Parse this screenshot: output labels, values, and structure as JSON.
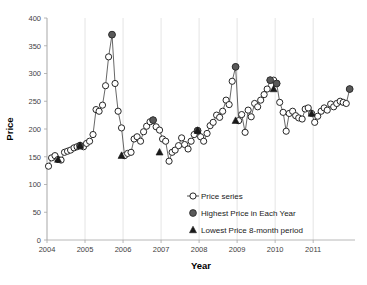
{
  "chart_data": {
    "type": "line",
    "title": "",
    "xlabel": "Year",
    "ylabel": "Price",
    "xlim": [
      2004,
      2012.1
    ],
    "ylim": [
      0,
      400
    ],
    "yticks": [
      0,
      50,
      100,
      150,
      200,
      250,
      300,
      350,
      400
    ],
    "xticks": [
      2004,
      2005,
      2006,
      2007,
      2008,
      2009,
      2010,
      2011
    ],
    "grid": "vertical-only",
    "legend_position": "inside-bottom-right",
    "series": [
      {
        "name": "Price series",
        "marker": "open-circle",
        "x": [
          2004.04,
          2004.12,
          2004.21,
          2004.29,
          2004.37,
          2004.46,
          2004.54,
          2004.62,
          2004.71,
          2004.79,
          2004.87,
          2004.96,
          2005.04,
          2005.12,
          2005.21,
          2005.29,
          2005.37,
          2005.46,
          2005.54,
          2005.62,
          2005.71,
          2005.79,
          2005.87,
          2005.96,
          2006.04,
          2006.12,
          2006.21,
          2006.29,
          2006.37,
          2006.46,
          2006.54,
          2006.62,
          2006.71,
          2006.79,
          2006.87,
          2006.96,
          2007.04,
          2007.12,
          2007.21,
          2007.29,
          2007.37,
          2007.46,
          2007.54,
          2007.62,
          2007.71,
          2007.79,
          2007.87,
          2007.96,
          2008.04,
          2008.12,
          2008.21,
          2008.29,
          2008.37,
          2008.46,
          2008.54,
          2008.62,
          2008.71,
          2008.79,
          2008.87,
          2008.96,
          2009.04,
          2009.12,
          2009.21,
          2009.29,
          2009.37,
          2009.46,
          2009.54,
          2009.62,
          2009.71,
          2009.79,
          2009.87,
          2009.96,
          2010.04,
          2010.12,
          2010.21,
          2010.29,
          2010.37,
          2010.46,
          2010.54,
          2010.62,
          2010.71,
          2010.79,
          2010.87,
          2010.96,
          2011.04,
          2011.12,
          2011.21,
          2011.29,
          2011.37,
          2011.46,
          2011.54,
          2011.62,
          2011.71,
          2011.79,
          2011.87,
          2011.96
        ],
        "y": [
          133,
          148,
          152,
          145,
          144,
          158,
          160,
          162,
          166,
          168,
          170,
          168,
          174,
          178,
          190,
          235,
          232,
          243,
          278,
          330,
          370,
          282,
          232,
          202,
          152,
          156,
          158,
          182,
          186,
          178,
          195,
          205,
          213,
          216,
          204,
          198,
          182,
          178,
          142,
          158,
          162,
          170,
          184,
          172,
          164,
          178,
          190,
          197,
          186,
          178,
          192,
          206,
          212,
          225,
          221,
          232,
          252,
          244,
          286,
          312,
          215,
          226,
          194,
          234,
          222,
          246,
          240,
          252,
          262,
          272,
          288,
          288,
          282,
          248,
          230,
          196,
          228,
          232,
          224,
          220,
          218,
          236,
          238,
          228,
          212,
          223,
          232,
          238,
          234,
          245,
          240,
          246,
          250,
          248,
          246,
          272
        ]
      },
      {
        "name": "Highest Price in Each Year",
        "marker": "filled-circle",
        "x": [
          2004.87,
          2005.71,
          2006.79,
          2007.96,
          2008.96,
          2009.87,
          2010.04,
          2011.96
        ],
        "y": [
          170,
          370,
          216,
          197,
          312,
          288,
          282,
          272
        ]
      },
      {
        "name": "Lowest Price 8-month period",
        "marker": "filled-triangle",
        "x": [
          2004.29,
          2004.87,
          2005.96,
          2006.96,
          2007.96,
          2008.96,
          2009.96,
          2010.96
        ],
        "y": [
          145,
          170,
          152,
          158,
          197,
          215,
          272,
          228
        ]
      }
    ],
    "legend": [
      {
        "label": "Price series",
        "marker": "open-circle-line"
      },
      {
        "label": "Highest Price in Each Year",
        "marker": "filled-circle"
      },
      {
        "label": "Lowest Price 8-month period",
        "marker": "filled-triangle"
      }
    ],
    "colors": {
      "line": "#404040",
      "marker_open_fill": "#ffffff",
      "marker_open_stroke": "#262626",
      "marker_filled": "#595959",
      "axis": "#a6a6a6",
      "gridline": "#d9d9d9",
      "text": "#3f3f3f",
      "title_text": "#000000"
    }
  }
}
